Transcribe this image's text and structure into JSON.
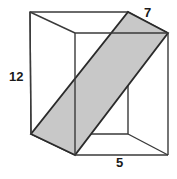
{
  "figure": {
    "name": "rectangular-prism-with-diagonal-cross-section",
    "background_color": "#ffffff",
    "edge_color": "#3a3a3a",
    "edge_color_dark": "#222222",
    "cross_section_fill": "#c8c8c8",
    "cross_section_stroke": "#2b2b2b",
    "canvas": {
      "width": 177,
      "height": 179
    }
  },
  "labels": {
    "height": "12",
    "depth": "7",
    "width": "5"
  },
  "geometry": {
    "vertices": {
      "back_top_left": [
        30,
        12
      ],
      "back_top_right": [
        128,
        12
      ],
      "front_top_left": [
        75,
        33
      ],
      "front_top_right": [
        168,
        33
      ],
      "back_bottom_left": [
        31,
        134
      ],
      "back_bottom_right": [
        128,
        134
      ],
      "front_bottom_left": [
        75,
        155
      ],
      "front_bottom_right": [
        168,
        155
      ]
    },
    "cross_section_polygon": [
      [
        75,
        155
      ],
      [
        31,
        134
      ],
      [
        128,
        12
      ],
      [
        168,
        33
      ]
    ]
  }
}
